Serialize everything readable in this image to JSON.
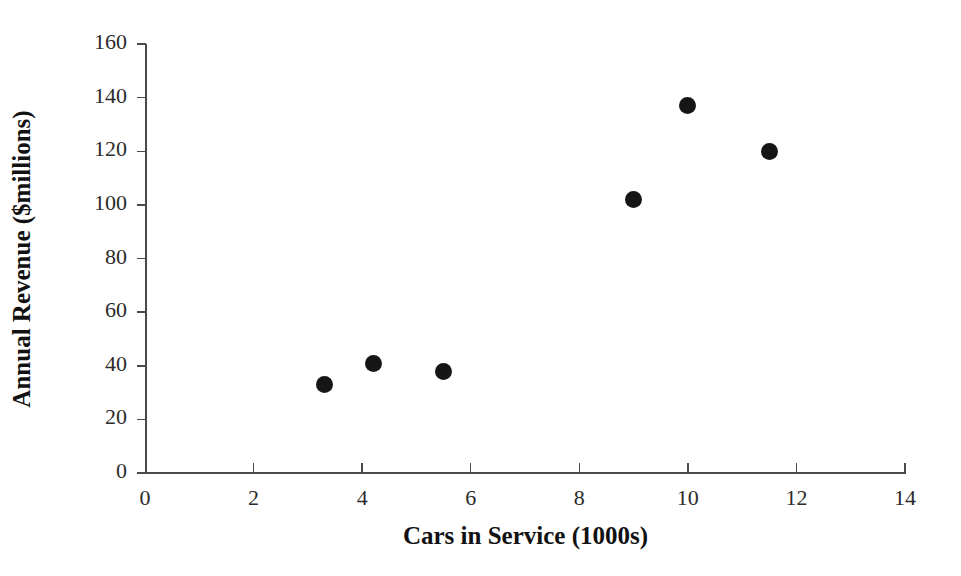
{
  "chart_data": {
    "type": "scatter",
    "title": "",
    "xlabel": "Cars in Service (1000s)",
    "ylabel": "Annual Revenue ($millions)",
    "xlim": [
      0,
      14
    ],
    "ylim": [
      0,
      160
    ],
    "xticks": [
      0,
      2,
      4,
      6,
      8,
      10,
      12,
      14
    ],
    "yticks": [
      0,
      20,
      40,
      60,
      80,
      100,
      120,
      140,
      160
    ],
    "xtick_labels": [
      "0",
      "2",
      "4",
      "6",
      "8",
      "10",
      "12",
      "14"
    ],
    "ytick_labels": [
      "0",
      "20",
      "40",
      "60",
      "80",
      "100",
      "120",
      "140",
      "160"
    ],
    "grid": false,
    "legend": null,
    "marker": "filled-circle",
    "marker_color": "#161616",
    "axis_color": "#4a4a4a",
    "background_color": "#ffffff",
    "points": [
      {
        "x": 3.3,
        "y": 33
      },
      {
        "x": 4.2,
        "y": 41
      },
      {
        "x": 5.5,
        "y": 38
      },
      {
        "x": 9.0,
        "y": 102
      },
      {
        "x": 10.0,
        "y": 137
      },
      {
        "x": 11.5,
        "y": 120
      }
    ],
    "series": [
      {
        "name": "",
        "x": [
          3.3,
          4.2,
          5.5,
          9.0,
          10.0,
          11.5
        ],
        "values": [
          33,
          41,
          38,
          102,
          137,
          120
        ]
      }
    ]
  }
}
